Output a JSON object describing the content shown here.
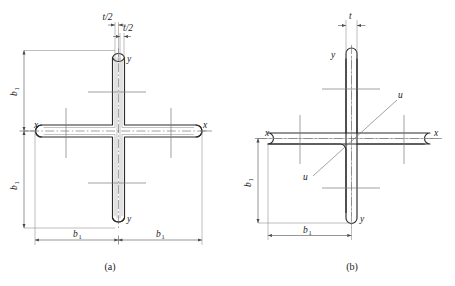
{
  "figure": {
    "panels": [
      {
        "id": "a",
        "caption": "(a)",
        "description": "Symmetric built-up cruciform section from two folded channels, double wall thickness t/2 each side",
        "labels": {
          "thickness_upper": "t/2",
          "thickness_lower": "t/2",
          "axis_x_left": "x",
          "axis_x_right": "x",
          "axis_y_top": "y",
          "axis_y_bottom": "y",
          "dim_vertical_upper": "b",
          "dim_vertical_upper_sub": "1",
          "dim_vertical_lower": "b",
          "dim_vertical_lower_sub": "1",
          "dim_horizontal_left": "b",
          "dim_horizontal_left_sub": "1",
          "dim_horizontal_right": "b",
          "dim_horizontal_right_sub": "1"
        }
      },
      {
        "id": "b",
        "caption": "(b)",
        "description": "Single angle cruciform section of uniform wall thickness t with principal axis u-u",
        "labels": {
          "thickness": "t",
          "axis_x_left": "x",
          "axis_x_right": "x",
          "axis_y_top": "y",
          "axis_y_bottom": "y",
          "axis_u_upper": "u",
          "axis_u_lower": "u",
          "dim_vertical": "b",
          "dim_vertical_sub": "1",
          "dim_horizontal": "b",
          "dim_horizontal_sub": "1"
        }
      }
    ]
  },
  "colors": {
    "outline": "#2b2b2b",
    "inner_wall": "#9a9a9a",
    "centerline": "#6f6f6f",
    "dimension": "#5d5d5d",
    "background": "#ffffff"
  }
}
